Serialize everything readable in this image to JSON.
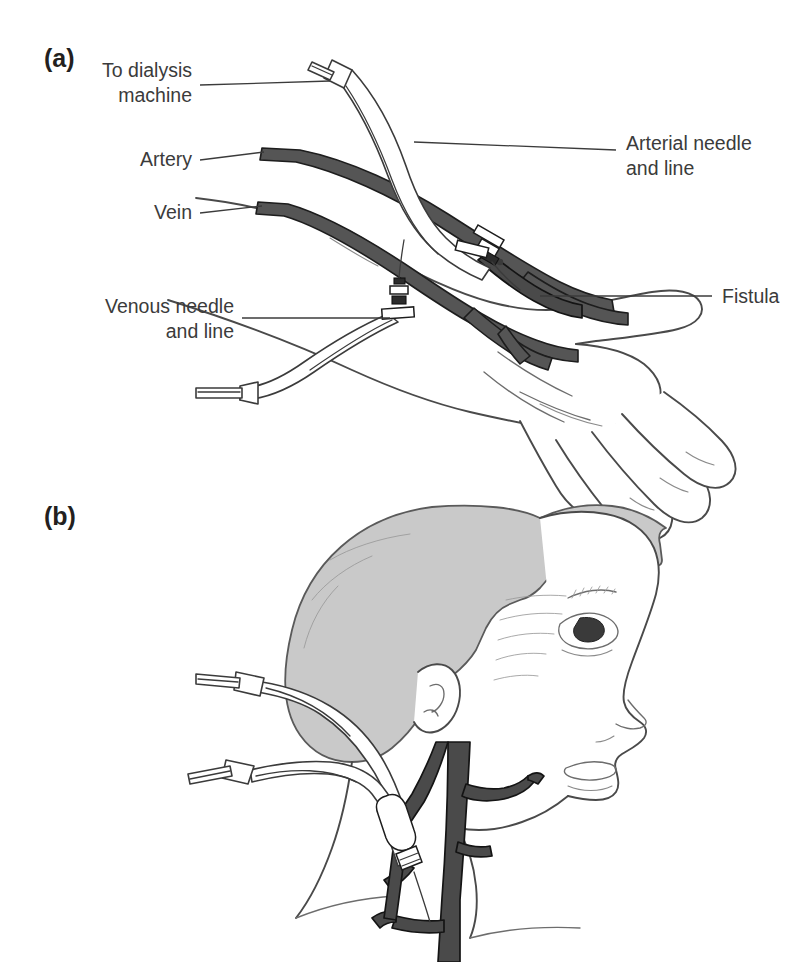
{
  "figure": {
    "panels": [
      {
        "letter": "(a)",
        "subject": "forearm arteriovenous fistula with dialysis needles",
        "labels": [
          {
            "id": "to-dialysis-machine",
            "lines": [
              "To dialysis",
              "machine"
            ],
            "align": "end"
          },
          {
            "id": "artery",
            "lines": [
              "Artery"
            ],
            "align": "end"
          },
          {
            "id": "vein",
            "lines": [
              "Vein"
            ],
            "align": "end"
          },
          {
            "id": "venous-needle-and-line",
            "lines": [
              "Venous needle",
              "and line"
            ],
            "align": "end"
          },
          {
            "id": "arterial-needle-and-line",
            "lines": [
              "Arterial needle",
              "and line"
            ],
            "align": "start"
          },
          {
            "id": "fistula",
            "lines": [
              "Fistula"
            ],
            "align": "start"
          }
        ]
      },
      {
        "letter": "(b)",
        "subject": "tunnelled central venous catheter in the internal jugular vein",
        "labels": []
      }
    ],
    "colors": {
      "vessel_fill": "#555555",
      "vessel_outline": "#1d1d1d",
      "hair_fill": "#c9c9c9",
      "skin_outline": "#4a4a4a",
      "tube_outline": "#3b3b3b",
      "label_text": "#3b3b3b",
      "panel_letter": "#231f20",
      "background": "#ffffff"
    }
  }
}
